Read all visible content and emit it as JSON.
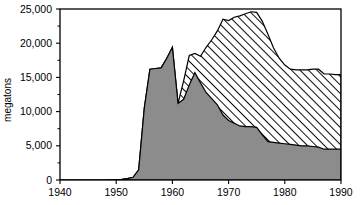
{
  "chart_data": {
    "type": "area",
    "title": "",
    "subtitle": "",
    "xlabel": "",
    "ylabel": "megatons",
    "xlim": [
      1940,
      1990
    ],
    "ylim": [
      0,
      25000
    ],
    "grid": false,
    "legend_position": "none",
    "stacked": true,
    "x_tick_labels": [
      "1940",
      "1950",
      "1960",
      "1970",
      "1980",
      "1990"
    ],
    "x_ticks": [
      1940,
      1950,
      1960,
      1970,
      1980,
      1990
    ],
    "y_tick_labels": [
      "0",
      "5,000",
      "10,000",
      "15,000",
      "20,000",
      "25,000"
    ],
    "y_ticks": [
      0,
      5000,
      10000,
      15000,
      20000,
      25000
    ],
    "y_minor_ticks": [
      2500,
      7500,
      12500,
      17500,
      22500
    ],
    "series": [
      {
        "name": "lower-solid-area",
        "fill_style": "solid-gray",
        "fill_color": "#8c8c8c",
        "x": [
          1940,
          1948,
          1951,
          1952,
          1953,
          1954,
          1955,
          1956,
          1957,
          1958,
          1959,
          1960,
          1961,
          1962,
          1963,
          1964,
          1965,
          1966,
          1967,
          1968,
          1969,
          1970,
          1971,
          1972,
          1973,
          1974,
          1975,
          1976,
          1977,
          1978,
          1979,
          1980,
          1981,
          1982,
          1983,
          1984,
          1985,
          1986,
          1987,
          1988,
          1989,
          1990
        ],
        "values": [
          0,
          0,
          100,
          200,
          400,
          1500,
          10500,
          16200,
          16300,
          16400,
          17800,
          19400,
          11200,
          11800,
          13900,
          15700,
          14200,
          12800,
          11900,
          11000,
          9500,
          8700,
          8300,
          7900,
          7800,
          7800,
          7700,
          6600,
          5600,
          5500,
          5400,
          5300,
          5200,
          5100,
          5000,
          5000,
          4900,
          4800,
          4500,
          4500,
          4500,
          4500
        ]
      },
      {
        "name": "upper-hatched-total",
        "fill_style": "diagonal-hatch",
        "fill_color": "#ffffff",
        "hatch_color": "#000000",
        "x": [
          1940,
          1948,
          1951,
          1952,
          1953,
          1954,
          1955,
          1956,
          1957,
          1958,
          1959,
          1960,
          1961,
          1962,
          1963,
          1964,
          1965,
          1966,
          1967,
          1968,
          1969,
          1970,
          1971,
          1972,
          1973,
          1974,
          1975,
          1976,
          1977,
          1978,
          1979,
          1980,
          1981,
          1982,
          1983,
          1984,
          1985,
          1986,
          1987,
          1988,
          1989,
          1990
        ],
        "values": [
          0,
          0,
          100,
          200,
          400,
          1500,
          10500,
          16200,
          16300,
          16400,
          17800,
          19400,
          11200,
          14500,
          18200,
          18500,
          18100,
          19400,
          20500,
          21800,
          23500,
          23300,
          23800,
          24000,
          24300,
          24600,
          24500,
          23200,
          21300,
          19300,
          17800,
          16800,
          16200,
          16100,
          16100,
          16100,
          16200,
          16200,
          15500,
          15500,
          15400,
          15400
        ]
      }
    ]
  },
  "axes": {
    "y_axis_title": "megatons"
  }
}
